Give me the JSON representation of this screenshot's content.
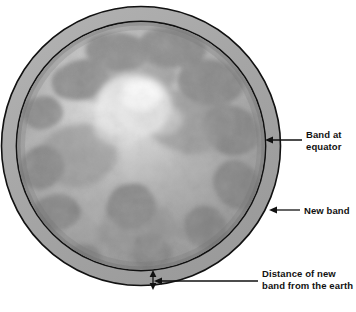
{
  "figure": {
    "background_color": "#ffffff",
    "stroke_color": "#111111",
    "band_ring_color": "#a8a8a8",
    "earth_base_color": "#9a9a9a",
    "earth_highlight_color": "#f2f2f2"
  },
  "annotations": [
    {
      "id": "band-at-equator",
      "line1": "Band at",
      "line2": "equator",
      "arrow": "left-pointing",
      "target": "inner band outline at equator"
    },
    {
      "id": "new-band",
      "line1": "New band",
      "line2": "",
      "arrow": "left-pointing",
      "target": "outer band ring"
    },
    {
      "id": "distance-of-new-band",
      "line1": "Distance of new",
      "line2": "band from the earth",
      "arrow": "double-headed vertical",
      "target": "gap between earth surface and new band"
    }
  ],
  "geometry": {
    "earth": {
      "cx": 141,
      "cy": 146,
      "r": 125
    },
    "new_band": {
      "cx": 141,
      "cy": 146,
      "r": 140
    },
    "units": "pixels"
  }
}
